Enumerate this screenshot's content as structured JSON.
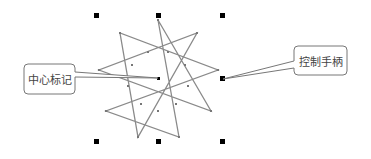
{
  "callouts": {
    "center_marker": {
      "label": "中心标记"
    },
    "control_handle": {
      "label": "控制手柄"
    }
  },
  "shape": {
    "type": "nine-pointed-star",
    "stroke": "#8a8a8a"
  },
  "colors": {
    "handle": "#000000",
    "callout_border": "#777777"
  }
}
